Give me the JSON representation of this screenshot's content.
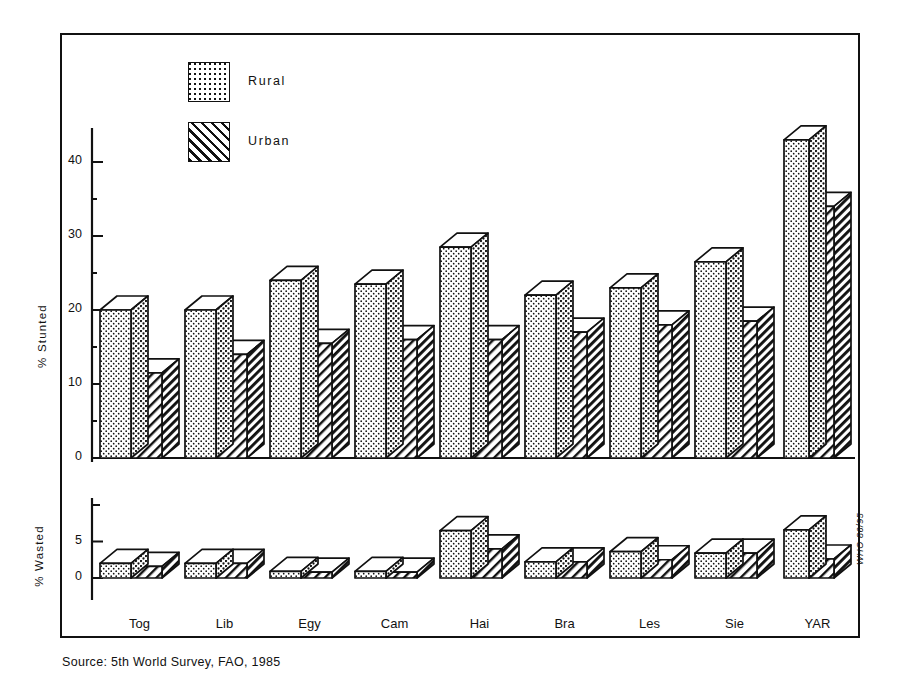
{
  "chart_data": {
    "type": "bar",
    "title": "",
    "categories": [
      "Tog",
      "Lib",
      "Egy",
      "Cam",
      "Hai",
      "Bra",
      "Les",
      "Sie",
      "YAR"
    ],
    "legend": {
      "position": "top-left-inside",
      "entries": [
        {
          "name": "Rural",
          "pattern": "dotted"
        },
        {
          "name": "Urban",
          "pattern": "diagonal-hatch"
        }
      ]
    },
    "panels": [
      {
        "id": "stunted",
        "ylabel": "% Stunted",
        "ylim": [
          0,
          45
        ],
        "yticks": [
          0,
          10,
          20,
          30,
          40
        ],
        "yminorticks": [
          5,
          15,
          25,
          35
        ],
        "grid": false,
        "series": [
          {
            "name": "Rural",
            "values": [
              20,
              20,
              24,
              23.5,
              28.5,
              22,
              23,
              26.5,
              43
            ]
          },
          {
            "name": "Urban",
            "values": [
              11.5,
              14,
              15.5,
              16,
              16,
              17,
              18,
              18.5,
              34
            ]
          }
        ]
      },
      {
        "id": "wasted",
        "ylabel": "% Wasted",
        "ylim": [
          0,
          10
        ],
        "yticks": [
          0,
          5
        ],
        "yminorticks": [
          10
        ],
        "grid": false,
        "series": [
          {
            "name": "Rural",
            "values": [
              2.0,
              2.0,
              0.9,
              0.9,
              6.5,
              2.2,
              3.6,
              3.4,
              6.6
            ]
          },
          {
            "name": "Urban",
            "values": [
              1.6,
              2.0,
              0.8,
              0.8,
              4.0,
              2.2,
              2.5,
              3.4,
              2.6
            ]
          }
        ]
      }
    ],
    "source_note": "Source: 5th World Survey, FAO, 1985",
    "who_code": "WHO 86/95"
  },
  "labels": {
    "stunted_axis_title": "% Stunted",
    "wasted_axis_title": "% Wasted",
    "legend_rural": "Rural",
    "legend_urban": "Urban"
  },
  "colors": {
    "ink": "#111111",
    "paper": "#ffffff",
    "bar_fill": "#ffffff",
    "bar_top": "#ffffff"
  }
}
